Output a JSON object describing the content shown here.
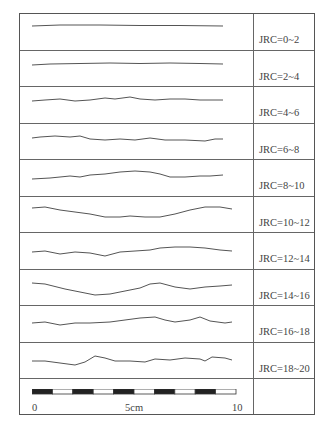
{
  "chart_data": {
    "type": "diagram",
    "profiles": [
      {
        "label": "JRC=0~2",
        "points": [
          [
            12,
            12
          ],
          [
            40,
            11
          ],
          [
            80,
            11
          ],
          [
            120,
            11.5
          ],
          [
            160,
            11.5
          ],
          [
            203,
            12
          ]
        ]
      },
      {
        "label": "JRC=2~4",
        "points": [
          [
            12,
            14
          ],
          [
            30,
            13
          ],
          [
            60,
            12.5
          ],
          [
            90,
            12
          ],
          [
            120,
            12.5
          ],
          [
            150,
            12
          ],
          [
            180,
            12.5
          ],
          [
            203,
            13
          ]
        ]
      },
      {
        "label": "JRC=4~6",
        "points": [
          [
            12,
            14
          ],
          [
            25,
            13
          ],
          [
            40,
            12
          ],
          [
            55,
            14
          ],
          [
            70,
            13
          ],
          [
            85,
            11
          ],
          [
            95,
            12
          ],
          [
            110,
            10
          ],
          [
            120,
            12
          ],
          [
            135,
            13
          ],
          [
            150,
            12
          ],
          [
            165,
            12
          ],
          [
            180,
            13
          ],
          [
            203,
            13
          ]
        ]
      },
      {
        "label": "JRC=6~8",
        "points": [
          [
            12,
            14
          ],
          [
            20,
            13
          ],
          [
            35,
            12
          ],
          [
            50,
            13
          ],
          [
            60,
            12
          ],
          [
            70,
            15
          ],
          [
            85,
            16
          ],
          [
            100,
            15
          ],
          [
            115,
            16
          ],
          [
            130,
            14
          ],
          [
            145,
            16
          ],
          [
            165,
            16
          ],
          [
            185,
            17
          ],
          [
            195,
            15
          ],
          [
            203,
            15
          ]
        ]
      },
      {
        "label": "JRC=8~10",
        "points": [
          [
            12,
            19
          ],
          [
            30,
            18
          ],
          [
            50,
            16
          ],
          [
            60,
            17
          ],
          [
            70,
            15
          ],
          [
            85,
            14
          ],
          [
            100,
            12
          ],
          [
            115,
            11
          ],
          [
            130,
            12
          ],
          [
            140,
            14
          ],
          [
            150,
            17
          ],
          [
            165,
            17
          ],
          [
            180,
            16
          ],
          [
            190,
            16
          ],
          [
            203,
            15
          ]
        ]
      },
      {
        "label": "JRC=10~12",
        "points": [
          [
            12,
            11
          ],
          [
            25,
            10
          ],
          [
            40,
            13
          ],
          [
            55,
            15
          ],
          [
            70,
            17
          ],
          [
            85,
            20
          ],
          [
            100,
            20
          ],
          [
            110,
            19
          ],
          [
            125,
            20
          ],
          [
            140,
            20
          ],
          [
            155,
            17
          ],
          [
            170,
            13
          ],
          [
            185,
            10
          ],
          [
            200,
            10
          ],
          [
            212,
            12
          ]
        ]
      },
      {
        "label": "JRC=12~14",
        "points": [
          [
            12,
            19
          ],
          [
            25,
            18
          ],
          [
            40,
            21
          ],
          [
            55,
            19
          ],
          [
            70,
            20
          ],
          [
            85,
            23
          ],
          [
            100,
            19
          ],
          [
            115,
            18
          ],
          [
            130,
            17
          ],
          [
            140,
            15
          ],
          [
            155,
            14
          ],
          [
            170,
            14
          ],
          [
            185,
            15
          ],
          [
            200,
            17
          ],
          [
            212,
            18
          ]
        ]
      },
      {
        "label": "JRC=14~16",
        "points": [
          [
            12,
            13
          ],
          [
            25,
            14
          ],
          [
            45,
            19
          ],
          [
            60,
            22
          ],
          [
            75,
            25
          ],
          [
            90,
            24
          ],
          [
            105,
            21
          ],
          [
            120,
            18
          ],
          [
            130,
            14
          ],
          [
            140,
            13
          ],
          [
            155,
            17
          ],
          [
            170,
            19
          ],
          [
            185,
            17
          ],
          [
            200,
            16
          ],
          [
            212,
            15
          ]
        ]
      },
      {
        "label": "JRC=16~18",
        "points": [
          [
            12,
            17
          ],
          [
            25,
            16
          ],
          [
            40,
            19
          ],
          [
            55,
            17
          ],
          [
            70,
            17
          ],
          [
            90,
            16
          ],
          [
            105,
            14
          ],
          [
            120,
            12
          ],
          [
            135,
            11
          ],
          [
            145,
            14
          ],
          [
            155,
            16
          ],
          [
            170,
            14
          ],
          [
            180,
            11
          ],
          [
            190,
            15
          ],
          [
            205,
            17
          ],
          [
            212,
            16
          ]
        ]
      },
      {
        "label": "JRC=18~20",
        "points": [
          [
            12,
            18
          ],
          [
            25,
            18
          ],
          [
            40,
            20
          ],
          [
            55,
            22
          ],
          [
            65,
            19
          ],
          [
            75,
            13
          ],
          [
            85,
            15
          ],
          [
            95,
            18
          ],
          [
            110,
            18
          ],
          [
            125,
            19
          ],
          [
            135,
            16
          ],
          [
            150,
            17
          ],
          [
            165,
            15
          ],
          [
            180,
            16
          ],
          [
            185,
            18
          ],
          [
            192,
            14
          ],
          [
            205,
            15
          ],
          [
            212,
            17
          ]
        ]
      }
    ],
    "scale_bar": {
      "ticks": [
        "0",
        "5cm",
        "10"
      ],
      "segments": 10
    }
  },
  "rows": [
    {
      "label": "JRC=0~2"
    },
    {
      "label": "JRC=2~4"
    },
    {
      "label": "JRC=4~6"
    },
    {
      "label": "JRC=6~8"
    },
    {
      "label": "JRC=8~10"
    },
    {
      "label": "JRC=10~12"
    },
    {
      "label": "JRC=12~14"
    },
    {
      "label": "JRC=14~16"
    },
    {
      "label": "JRC=16~18"
    },
    {
      "label": "JRC=18~20"
    }
  ],
  "scale": {
    "tick_0": "0",
    "tick_mid": "5cm",
    "tick_end": "10"
  }
}
